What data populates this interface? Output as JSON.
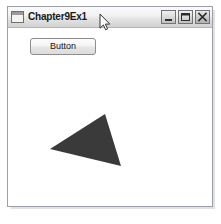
{
  "window": {
    "title": "Chapter9Ex1",
    "icon": "window-document-icon",
    "controls": [
      {
        "name": "minimize",
        "label": "_",
        "glyph": "minimize-icon"
      },
      {
        "name": "maximize",
        "label": "□",
        "glyph": "maximize-icon"
      },
      {
        "name": "close",
        "label": "✕",
        "glyph": "close-icon"
      }
    ],
    "frame_color": "#9aa0a6",
    "titlebar_color": "#e8e8e8",
    "client_color": "#ffffff"
  },
  "client": {
    "button": {
      "label": "Button"
    },
    "graphic": {
      "shape": "triangle",
      "fill": "#3a3a3a",
      "points": [
        {
          "x": 105,
          "y": 114
        },
        {
          "x": 50,
          "y": 149
        },
        {
          "x": 121,
          "y": 166
        }
      ]
    }
  },
  "cursor": {
    "type": "arrow-pointer",
    "x": 99,
    "y": 13
  }
}
